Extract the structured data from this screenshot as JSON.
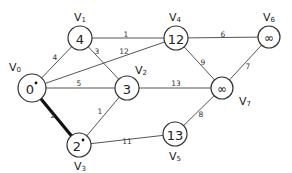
{
  "diagram": {
    "type": "weighted-undirected-graph",
    "nodes": [
      {
        "id": "V0",
        "label": "V",
        "sub": "0",
        "value": "0",
        "marked": true,
        "x": 32,
        "y": 88,
        "r": 14,
        "lx": 15,
        "ly": 67
      },
      {
        "id": "V1",
        "label": "V",
        "sub": "1",
        "value": "4",
        "marked": false,
        "x": 80,
        "y": 38,
        "r": 12,
        "lx": 80,
        "ly": 17
      },
      {
        "id": "V2",
        "label": "V",
        "sub": "2",
        "value": "3",
        "marked": false,
        "x": 127,
        "y": 88,
        "r": 12,
        "lx": 141,
        "ly": 70
      },
      {
        "id": "V3",
        "label": "V",
        "sub": "3",
        "value": "2",
        "marked": true,
        "x": 79,
        "y": 145,
        "r": 12,
        "lx": 80,
        "ly": 166
      },
      {
        "id": "V4",
        "label": "V",
        "sub": "4",
        "value": "12",
        "marked": false,
        "x": 176,
        "y": 38,
        "r": 12,
        "lx": 175,
        "ly": 17
      },
      {
        "id": "V5",
        "label": "V",
        "sub": "5",
        "value": "13",
        "marked": false,
        "x": 175,
        "y": 134,
        "r": 12,
        "lx": 175,
        "ly": 156
      },
      {
        "id": "V6",
        "label": "V",
        "sub": "6",
        "value": "∞",
        "marked": false,
        "x": 269,
        "y": 37,
        "r": 11,
        "lx": 269,
        "ly": 17
      },
      {
        "id": "V7",
        "label": "V",
        "sub": "7",
        "value": "∞",
        "marked": false,
        "x": 222,
        "y": 88,
        "r": 11,
        "lx": 245,
        "ly": 101
      }
    ],
    "edges": [
      {
        "from": "V0",
        "to": "V1",
        "weight": "4",
        "bold": false,
        "wx": 55,
        "wy": 57
      },
      {
        "from": "V0",
        "to": "V4",
        "weight": "12",
        "bold": false,
        "wx": 124,
        "wy": 51
      },
      {
        "from": "V0",
        "to": "V2",
        "weight": "5",
        "bold": false,
        "wx": 79,
        "wy": 83
      },
      {
        "from": "V0",
        "to": "V3",
        "weight": "2",
        "bold": true,
        "wx": 53,
        "wy": 115
      },
      {
        "from": "V1",
        "to": "V4",
        "weight": "1",
        "bold": false,
        "wx": 126,
        "wy": 34
      },
      {
        "from": "V1",
        "to": "V2",
        "weight": "3",
        "bold": false,
        "wx": 97,
        "wy": 51
      },
      {
        "from": "V2",
        "to": "V3",
        "weight": "1",
        "bold": false,
        "wx": 100,
        "wy": 111
      },
      {
        "from": "V2",
        "to": "V7",
        "weight": "13",
        "bold": false,
        "wx": 176,
        "wy": 83
      },
      {
        "from": "V4",
        "to": "V6",
        "weight": "6",
        "bold": false,
        "wx": 223,
        "wy": 34
      },
      {
        "from": "V4",
        "to": "V7",
        "weight": "9",
        "bold": false,
        "wx": 203,
        "wy": 62
      },
      {
        "from": "V6",
        "to": "V7",
        "weight": "7",
        "bold": false,
        "wx": 248,
        "wy": 66
      },
      {
        "from": "V3",
        "to": "V5",
        "weight": "11",
        "bold": false,
        "wx": 127,
        "wy": 141
      },
      {
        "from": "V5",
        "to": "V7",
        "weight": "8",
        "bold": false,
        "wx": 201,
        "wy": 114
      }
    ]
  }
}
